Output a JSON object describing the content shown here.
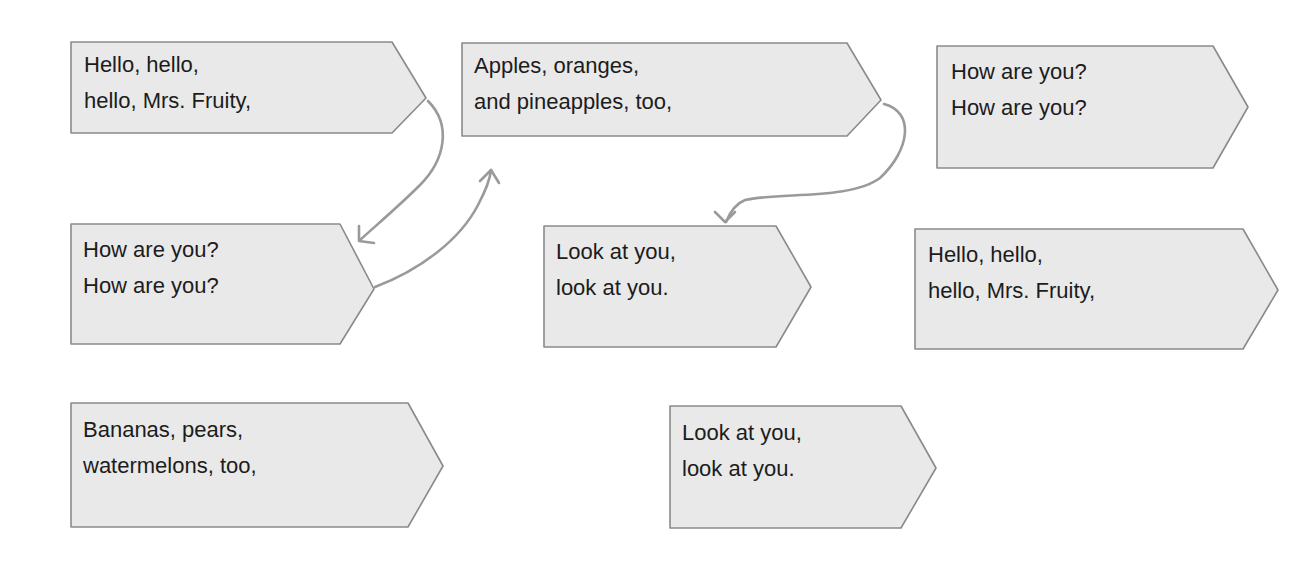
{
  "diagram": {
    "colors": {
      "box_fill": "#e9e9e9",
      "box_stroke": "#8a8a8a",
      "connector": "#9a9a9a",
      "text": "#1c1c1c"
    },
    "boxes": [
      {
        "id": "box-1",
        "line1": "Hello, hello,",
        "line2": "hello, Mrs. Fruity,"
      },
      {
        "id": "box-2",
        "line1": "Apples, oranges,",
        "line2": "and pineapples, too,"
      },
      {
        "id": "box-3",
        "line1": "How are you?",
        "line2": "How are you?"
      },
      {
        "id": "box-4",
        "line1": "How are you?",
        "line2": "How are you?"
      },
      {
        "id": "box-5",
        "line1": "Look at you,",
        "line2": "look at you."
      },
      {
        "id": "box-6",
        "line1": "Hello, hello,",
        "line2": "hello, Mrs. Fruity,"
      },
      {
        "id": "box-7",
        "line1": "Bananas, pears,",
        "line2": "watermelons, too,"
      },
      {
        "id": "box-8",
        "line1": "Look at you,",
        "line2": "look at you."
      }
    ],
    "connectors": [
      {
        "from": "box-1",
        "to": "box-4",
        "icon": "curved-arrow-icon"
      },
      {
        "from": "box-4",
        "to": "box-2",
        "icon": "curved-arrow-icon"
      },
      {
        "from": "box-2",
        "to": "box-5",
        "icon": "curved-arrow-icon"
      }
    ]
  }
}
